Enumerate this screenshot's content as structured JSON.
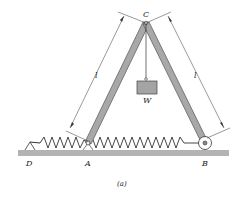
{
  "diagram": {
    "caption": "(a)",
    "points": {
      "A": "A",
      "B": "B",
      "C": "C",
      "D": "D"
    },
    "weight_label": "W",
    "dimensions": {
      "left_length": "l",
      "right_length": "l"
    },
    "colors": {
      "bar_fill": "#a8a8a8",
      "bar_stroke": "#555555",
      "ground_fill": "#b0b0b0",
      "weight_fill": "#a4a4a4",
      "line": "#333333"
    }
  }
}
